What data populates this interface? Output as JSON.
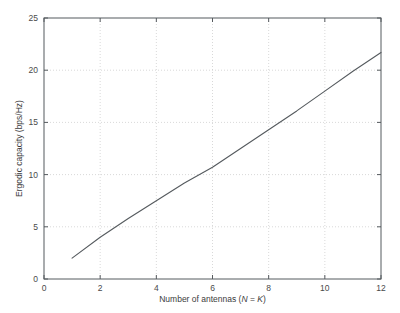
{
  "chart_data": {
    "type": "line",
    "title": "",
    "xlabel": "Number of antennas (N = K)",
    "xlabel_parts": {
      "prefix": "Number of antennas (",
      "sym1": "N",
      "mid": " = ",
      "sym2": "K",
      "suffix": ")"
    },
    "ylabel": "Ergodic capacity (bps/Hz)",
    "xlim": [
      0,
      12
    ],
    "ylim": [
      0,
      25
    ],
    "xticks": [
      0,
      2,
      4,
      6,
      8,
      10,
      12
    ],
    "yticks": [
      0,
      5,
      10,
      15,
      20,
      25
    ],
    "xtick_labels": [
      "0",
      "2",
      "4",
      "6",
      "8",
      "10",
      "12"
    ],
    "ytick_labels": [
      "0",
      "5",
      "10",
      "15",
      "20",
      "25"
    ],
    "grid": true,
    "grid_style": "dotted",
    "legend": null,
    "series": [
      {
        "name": "Ergodic capacity",
        "color": "#555a5e",
        "x": [
          1,
          2,
          3,
          4,
          5,
          6,
          7,
          8,
          9,
          10,
          11,
          12
        ],
        "values": [
          2.0,
          4.0,
          5.8,
          7.5,
          9.2,
          10.7,
          12.5,
          14.3,
          16.1,
          18.0,
          19.9,
          21.7
        ]
      }
    ]
  },
  "figure": {
    "background_color": "#ffffff",
    "axes_color": "#555a5e",
    "grid_color": "#c8c8c8"
  }
}
